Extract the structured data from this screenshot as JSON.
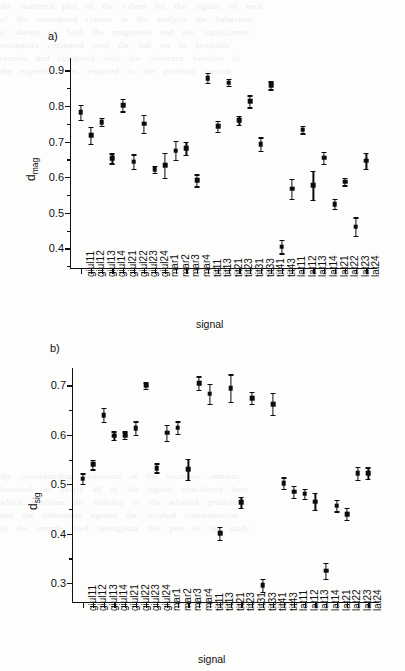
{
  "figure": {
    "background_color": "#fdfdfc",
    "marker_color": "#0c0c0c",
    "axis_color": "#111111"
  },
  "panels": [
    {
      "tag": "a)",
      "ylabel_main": "d",
      "ylabel_sub": "mag",
      "xlabel": "signal"
    },
    {
      "tag": "b)",
      "ylabel_main": "d",
      "ylabel_sub": "sig",
      "xlabel": "signal"
    }
  ],
  "chart_data": [
    {
      "type": "scatter",
      "panel": "a)",
      "title": "",
      "xlabel": "signal",
      "ylabel": "d_mag",
      "ylim": [
        0.345,
        0.935
      ],
      "yticks": [
        0.4,
        0.5,
        0.6,
        0.7,
        0.8,
        0.9
      ],
      "ytick_labels": [
        "0.4",
        "0.5",
        "0.6",
        "0.7",
        "0.8",
        "0.9"
      ],
      "grid": false,
      "legend": false,
      "errorbars": true,
      "categories": [
        "giul11",
        "giul12",
        "giul13",
        "giul14",
        "giul21",
        "giul22",
        "giul23",
        "giul24",
        "mar1",
        "mar2",
        "mar3",
        "mar4",
        "tit11",
        "tit13",
        "tit21",
        "tit23",
        "tit31",
        "tit33",
        "tit41",
        "tit43",
        "lat11",
        "lat12",
        "lat13",
        "lat14",
        "lat21",
        "lat22",
        "lat23",
        "lat24"
      ],
      "values": [
        0.783,
        0.718,
        0.755,
        0.653,
        0.802,
        0.644,
        0.75,
        0.622,
        0.633,
        0.675,
        0.681,
        0.591,
        0.879,
        0.743,
        0.866,
        0.76,
        0.813,
        0.693,
        0.858,
        0.405,
        0.568,
        0.734,
        0.577,
        0.655,
        0.524,
        0.588,
        0.461,
        0.646
      ],
      "errors": [
        0.021,
        0.024,
        0.011,
        0.014,
        0.017,
        0.02,
        0.025,
        0.01,
        0.035,
        0.027,
        0.019,
        0.017,
        0.015,
        0.015,
        0.01,
        0.013,
        0.017,
        0.019,
        0.011,
        0.019,
        0.028,
        0.011,
        0.041,
        0.017,
        0.014,
        0.011,
        0.026,
        0.022
      ]
    },
    {
      "type": "scatter",
      "panel": "b)",
      "title": "",
      "xlabel": "signal",
      "ylabel": "d_sig",
      "ylim": [
        0.262,
        0.735
      ],
      "yticks": [
        0.3,
        0.4,
        0.5,
        0.6,
        0.7
      ],
      "ytick_labels": [
        "0.3",
        "0.4",
        "0.5",
        "0.6",
        "0.7"
      ],
      "grid": false,
      "legend": false,
      "errorbars": true,
      "categories": [
        "giul11",
        "giul12",
        "giul13",
        "giul14",
        "giul21",
        "giul22",
        "giul23",
        "giul24",
        "mar1",
        "mar2",
        "mar3",
        "mar4",
        "tit11",
        "tit13",
        "tit21",
        "tit23",
        "tit31",
        "tit33",
        "tit41",
        "tit43",
        "lat11",
        "lat12",
        "lat13",
        "lat14",
        "lat21",
        "lat22",
        "lat23",
        "lat24"
      ],
      "values": [
        0.511,
        0.54,
        0.64,
        0.598,
        0.599,
        0.613,
        0.699,
        0.533,
        0.604,
        0.614,
        0.53,
        0.704,
        0.683,
        0.401,
        0.694,
        0.464,
        0.674,
        0.296,
        0.662,
        0.502,
        0.485,
        0.481,
        0.465,
        0.325,
        0.457,
        0.44,
        0.522,
        0.522
      ],
      "errors": [
        0.011,
        0.01,
        0.014,
        0.009,
        0.008,
        0.014,
        0.007,
        0.009,
        0.016,
        0.013,
        0.021,
        0.014,
        0.02,
        0.013,
        0.028,
        0.011,
        0.012,
        0.013,
        0.022,
        0.012,
        0.012,
        0.01,
        0.017,
        0.016,
        0.012,
        0.012,
        0.013,
        0.012
      ]
    }
  ],
  "ghost_text": [
    "the scattered plot of the values for the signals of each",
    "of the considered classes in the analysis the behaviour",
    "is shown for both the magnitude and the significance",
    "estimators computed over the full set of available",
    "records and compared with the reference baseline of",
    "the experiment as reported in the previous section"
  ],
  "ghost_text_bottom": [
    "the corresponding dispersion of the estimator remains",
    "bounded for nearly all of the signals considered here",
    "which confirms the stability of the adopted procedure",
    "and the robustness against the residual contamination",
    "of the sample used throughout this part of the study"
  ]
}
